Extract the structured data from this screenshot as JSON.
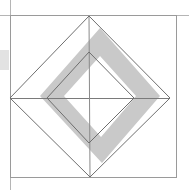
{
  "canvas": {
    "width": 189,
    "height": 190,
    "background_color": "#ffffff",
    "title": "Nested rotated squares geometric figure"
  },
  "palette": {
    "background": "#ffffff",
    "stroke_outer": "#9a9a9a",
    "stroke_diamond": "#707070",
    "stroke_inner_diamond": "#6e6e6e",
    "shade_fill": "#c9c9c9",
    "shade_fill_light": "#d6d6d6",
    "edge_block": "#e2e2e2",
    "edge_block_border": "#bdbdbd"
  },
  "figure": {
    "name": "nested-rotated-squares",
    "elements": [
      {
        "id": "outer-frame",
        "shape": "rectangle",
        "label": "Outer square frame",
        "x": 10,
        "y": 15,
        "width": 167,
        "height": 163,
        "stroke": "#9a9a9a",
        "stroke_width": 1,
        "fill": "none"
      },
      {
        "id": "outer-diamond",
        "shape": "polygon",
        "label": "Large inscribed rotated square",
        "points": "89,16 170,98 90,177 10,98",
        "stroke": "#707070",
        "stroke_width": 1,
        "fill": "none"
      },
      {
        "id": "inner-diamond",
        "shape": "polygon",
        "label": "Small concentric rotated square",
        "points": "89,52 134,98 89,143 47,98",
        "stroke": "#6e6e6e",
        "stroke_width": 1,
        "fill": "none"
      },
      {
        "id": "shaded-band",
        "shape": "polygon-with-hole",
        "label": "Grey band forming an offset rotated square ring",
        "outer_points": "100,28 160,96 102,163 40,96",
        "inner_points": "100,56 136,96 101,137 64,96",
        "fill": "#c9c9c9",
        "stroke": "none"
      },
      {
        "id": "horizontal-axis",
        "shape": "line",
        "label": "Horizontal diagonal of the large rotated square",
        "x1": 10,
        "y1": 98,
        "x2": 170,
        "y2": 98,
        "stroke": "#7a7a7a",
        "stroke_width": 1
      },
      {
        "id": "vertical-axis",
        "shape": "line",
        "label": "Vertical diagonal of the large rotated square",
        "x1": 89,
        "y1": 16,
        "x2": 90,
        "y2": 177,
        "stroke": "#8a8a8a",
        "stroke_width": 1
      },
      {
        "id": "left-edge-block",
        "shape": "rectangle",
        "label": "Grey block at the left image margin",
        "x": 0,
        "y": 50,
        "width": 9,
        "height": 20,
        "fill": "#e2e2e2",
        "stroke": "none"
      },
      {
        "id": "left-margin-rule",
        "shape": "line",
        "label": "Vertical rule along the left margin",
        "x1": 10,
        "y1": 0,
        "x2": 10,
        "y2": 190,
        "stroke": "#b5b5b5",
        "stroke_width": 1
      },
      {
        "id": "top-margin-rule",
        "shape": "line",
        "label": "Horizontal rule along the top margin",
        "x1": 0,
        "y1": 15,
        "x2": 189,
        "y2": 15,
        "stroke": "#b5b5b5",
        "stroke_width": 1
      }
    ],
    "vertices": {
      "outer_diamond_top": [
        89,
        16
      ],
      "outer_diamond_right": [
        170,
        98
      ],
      "outer_diamond_bottom": [
        90,
        177
      ],
      "outer_diamond_left": [
        10,
        98
      ],
      "inner_diamond_top": [
        89,
        52
      ],
      "inner_diamond_right": [
        134,
        98
      ],
      "inner_diamond_bottom": [
        89,
        143
      ],
      "inner_diamond_left": [
        47,
        98
      ],
      "frame_top_left": [
        10,
        15
      ],
      "frame_bottom_right": [
        177,
        178
      ]
    }
  }
}
